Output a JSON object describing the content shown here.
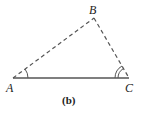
{
  "diagram": {
    "caption": "(b)",
    "vertices": {
      "A": {
        "label": "A",
        "x": 13,
        "y": 78
      },
      "B": {
        "label": "B",
        "x": 94,
        "y": 18
      },
      "C": {
        "label": "C",
        "x": 129,
        "y": 78
      }
    },
    "edges": [
      {
        "from": "A",
        "to": "C",
        "style": "solid"
      },
      {
        "from": "A",
        "to": "B",
        "style": "dashed"
      },
      {
        "from": "B",
        "to": "C",
        "style": "dashed"
      }
    ],
    "angle_marks": [
      {
        "vertex": "A",
        "arcs": 1
      },
      {
        "vertex": "C",
        "arcs": 2
      }
    ],
    "colors": {
      "line": "#555555",
      "text": "#222222"
    }
  }
}
